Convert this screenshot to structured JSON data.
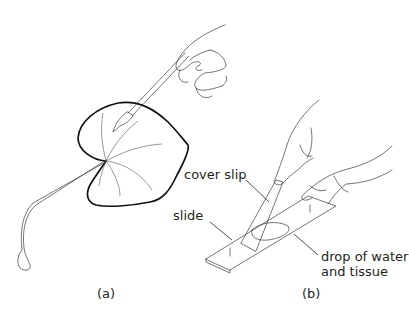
{
  "figure": {
    "panels": [
      {
        "id": "a",
        "caption": "(a)",
        "description": "Hand using forceps to peel tissue from a leaf with a long petiole"
      },
      {
        "id": "b",
        "caption": "(b)",
        "description": "Hands lowering a cover slip onto a slide"
      }
    ],
    "labels": {
      "cover_slip": "cover slip",
      "slide": "slide",
      "drop_line1": "drop of water",
      "drop_line2": "and tissue"
    }
  }
}
